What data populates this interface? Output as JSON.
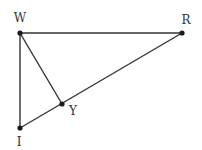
{
  "diagram": {
    "type": "geometry-triangle",
    "points": {
      "W": {
        "label": "W",
        "x": 20,
        "y": 33,
        "label_x": 20,
        "label_y": 22
      },
      "R": {
        "label": "R",
        "x": 182,
        "y": 33,
        "label_x": 186,
        "label_y": 24
      },
      "I": {
        "label": "I",
        "x": 20,
        "y": 128,
        "label_x": 19,
        "label_y": 146
      },
      "Y": {
        "label": "Y",
        "x": 62,
        "y": 104,
        "label_x": 73,
        "label_y": 115
      }
    },
    "segments": [
      {
        "from": "W",
        "to": "R"
      },
      {
        "from": "W",
        "to": "I"
      },
      {
        "from": "I",
        "to": "R"
      },
      {
        "from": "W",
        "to": "Y"
      }
    ],
    "colors": {
      "line": "#333333",
      "point": "#1a1a1a",
      "text": "#333333"
    }
  }
}
